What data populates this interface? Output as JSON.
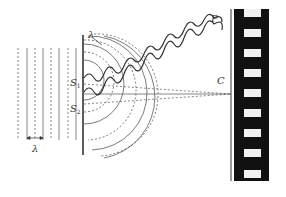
{
  "diagram": {
    "labels": {
      "slit1": "S",
      "slit1_sub": "1",
      "slit2": "S",
      "slit2_sub": "2",
      "point_p": "P",
      "point_c": "C",
      "lambda_plane": "λ",
      "lambda_circ": "λ"
    },
    "colors": {
      "line": "#333333",
      "screen": "#111111",
      "slot": "#f2f2f2"
    }
  }
}
